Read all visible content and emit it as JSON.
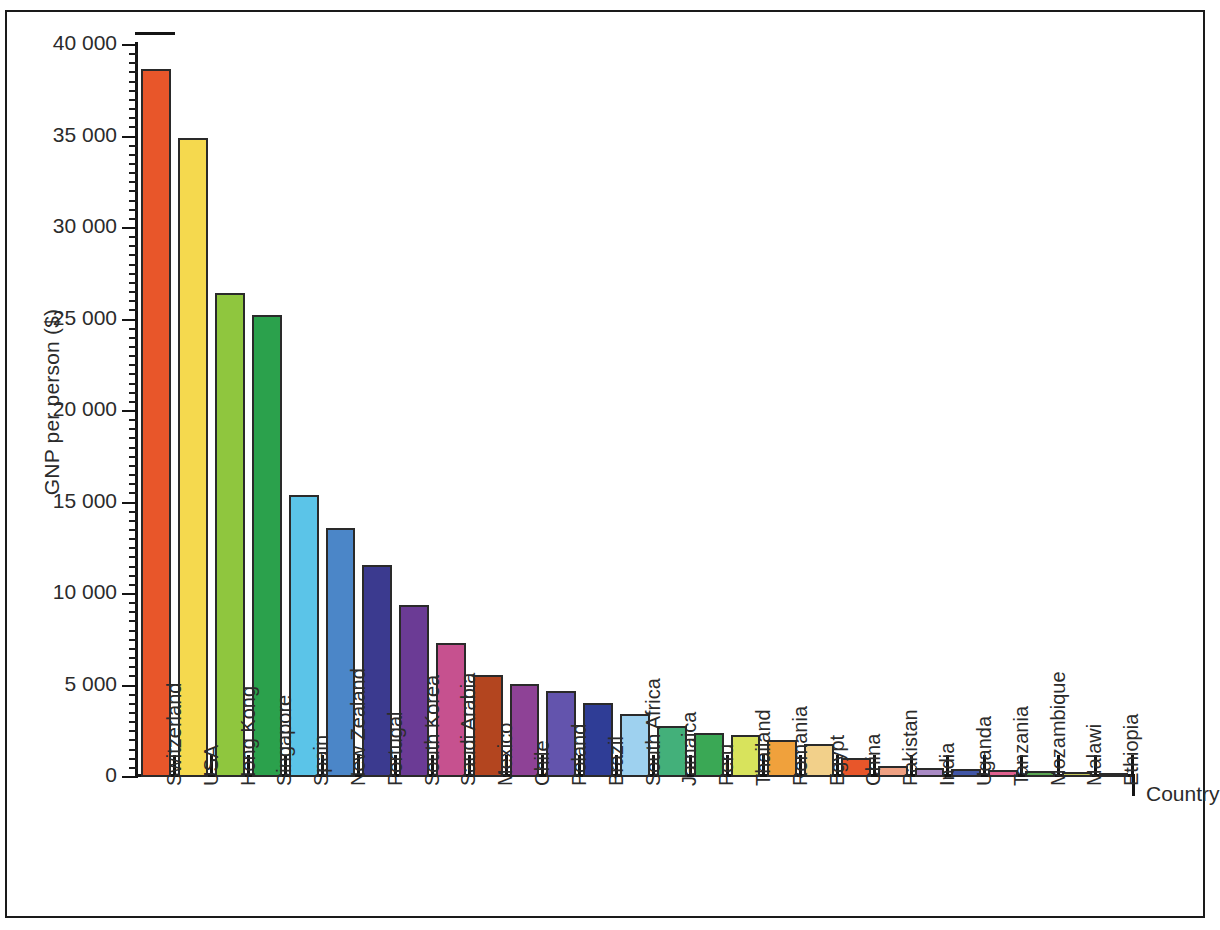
{
  "chart_data": {
    "type": "bar",
    "title": "",
    "subtitle": "",
    "xlabel": "Country",
    "ylabel": "GNP per person ($)",
    "ylim": [
      0,
      40000
    ],
    "ytick_labels": [
      "0",
      "5 000",
      "10 000",
      "15 000",
      "20 000",
      "25 000",
      "30 000",
      "35 000",
      "40 000"
    ],
    "ytick_values": [
      0,
      5000,
      10000,
      15000,
      20000,
      25000,
      30000,
      35000,
      40000
    ],
    "grid": false,
    "legend": "none",
    "axis_break_top": true,
    "categories": [
      "Switzerland",
      "USA",
      "Hong Kong",
      "Singapore",
      "Spain",
      "New Zealand",
      "Portugal",
      "South Korea",
      "Saudi Arabia",
      "Mexico",
      "Chile",
      "Poland",
      "Brazil",
      "South Africa",
      "Jamaica",
      "Peru",
      "Thailand",
      "Romania",
      "Egypt",
      "China",
      "Pakistan",
      "India",
      "Uganda",
      "Tanzania",
      "Mozambique",
      "Malawi",
      "Ethiopia"
    ],
    "values": [
      38700,
      34900,
      26450,
      25250,
      15400,
      13600,
      11600,
      9400,
      7350,
      5600,
      5100,
      4700,
      4050,
      3450,
      2800,
      2400,
      2300,
      2000,
      1800,
      1050,
      600,
      500,
      450,
      400,
      350,
      260,
      130
    ],
    "colors": [
      "#e8562a",
      "#f5d94e",
      "#8fc63e",
      "#2ba14c",
      "#5bc4e8",
      "#4b86c8",
      "#3b3a8f",
      "#6b3b95",
      "#c6518f",
      "#b3451f",
      "#8e4296",
      "#6354ad",
      "#2f3d96",
      "#9ed1ef",
      "#43b07a",
      "#3aa855",
      "#d8e35c",
      "#f0a13c",
      "#f2d08a",
      "#e8562a",
      "#efa183",
      "#a98ac4",
      "#4156a6",
      "#e0618f",
      "#5aa653",
      "#c3c55a",
      "#2b2b2b"
    ]
  },
  "axis": {
    "y_axis_label": "GNP per person ($)",
    "x_axis_label": "Country"
  }
}
